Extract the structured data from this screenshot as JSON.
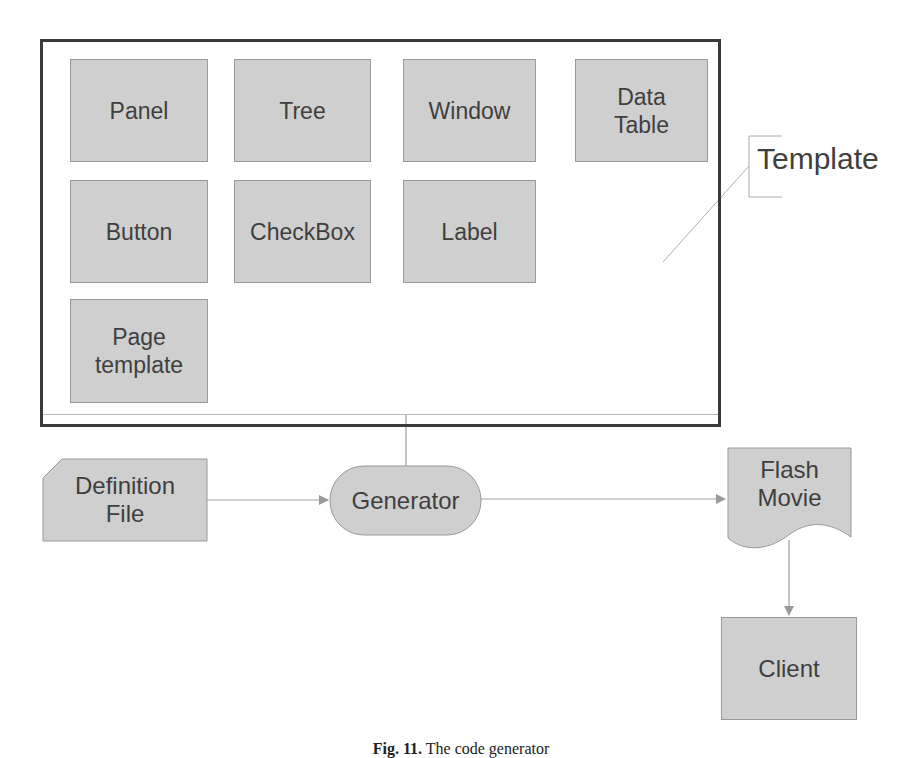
{
  "template_group": {
    "label": "Template",
    "components": [
      {
        "label": "Panel"
      },
      {
        "label": "Tree"
      },
      {
        "label": "Window"
      },
      {
        "label": "Data\nTable"
      },
      {
        "label": "Button"
      },
      {
        "label": "CheckBox"
      },
      {
        "label": "Label"
      },
      {
        "label": "Page\ntemplate"
      }
    ]
  },
  "flow": {
    "definition_file": "Definition\nFile",
    "generator": "Generator",
    "flash_movie": "Flash\nMovie",
    "client": "Client"
  },
  "caption": {
    "fig": "Fig. 11.",
    "text": " The code generator"
  },
  "colors": {
    "box_fill": "#cfcfcf",
    "box_border": "#9a9a9a",
    "frame": "#3a3a3a",
    "text": "#3f3f3f",
    "connector": "#9a9a9a"
  }
}
